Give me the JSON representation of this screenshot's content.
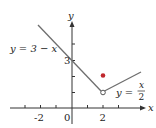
{
  "figure": {
    "axes": {
      "x_label": "x",
      "y_label": "y",
      "x_ticks": [
        -3,
        -2,
        -1,
        0,
        1,
        2,
        3
      ],
      "x_tick_labels": [
        "-2",
        "0",
        "2"
      ],
      "y_ticks": [
        1,
        2,
        3,
        4
      ],
      "y_tick_labels": [
        "3"
      ]
    },
    "curves": [
      {
        "name": "left-line",
        "label": "y = 3 − x",
        "expression": "3 - x",
        "domain": [
          -2.2,
          2
        ]
      },
      {
        "name": "right-line",
        "label_lhs": "y =",
        "label_num": "x",
        "label_den": "2",
        "expression": "x/2",
        "domain": [
          2,
          4.4
        ]
      }
    ],
    "points": [
      {
        "name": "filled-point",
        "x": 2,
        "y": 2,
        "style": "filled"
      },
      {
        "name": "open-point",
        "x": 2,
        "y": 1,
        "style": "open"
      }
    ],
    "colors": {
      "line": "#6e6e6e",
      "axis": "#333333",
      "point": "#c0282d"
    }
  }
}
